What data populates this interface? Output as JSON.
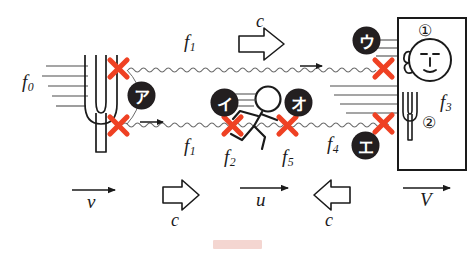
{
  "diagram": {
    "colors": {
      "ink": "#1a1a1a",
      "cross_red": "#ef4123",
      "marker_fill": "#231f20",
      "marker_text": "#ffffff",
      "wave": "#4d4d4d",
      "watermark": "#f2cfc9",
      "background": "#ffffff"
    }
  },
  "frequency_labels": [
    {
      "id": "f0",
      "base": "f",
      "sub": "0",
      "note": "source frequency at tuning fork"
    },
    {
      "id": "f1_top",
      "base": "f",
      "sub": "1",
      "note": "upper wave train frequency"
    },
    {
      "id": "f1_bottom",
      "base": "f",
      "sub": "1",
      "note": "lower wave train frequency"
    },
    {
      "id": "f2",
      "base": "f",
      "sub": "2",
      "note": "frequency at runner, left side"
    },
    {
      "id": "f5",
      "base": "f",
      "sub": "5",
      "note": "frequency at runner, right side"
    },
    {
      "id": "f4",
      "base": "f",
      "sub": "4",
      "note": "frequency approaching the wall"
    },
    {
      "id": "f3",
      "base": "f",
      "sub": "3",
      "note": "frequency heard by listener"
    }
  ],
  "velocity_labels": [
    {
      "id": "v",
      "text": "v",
      "note": "tuning fork velocity, arrow right"
    },
    {
      "id": "u",
      "text": "u",
      "note": "runner velocity, arrow right"
    },
    {
      "id": "V",
      "text": "V",
      "note": "wall/panel velocity, arrow right"
    }
  ],
  "sound_speed_labels": [
    {
      "id": "c_top",
      "text": "c",
      "direction": "right"
    },
    {
      "id": "c_bottom_left",
      "text": "c",
      "direction": "right"
    },
    {
      "id": "c_bottom_right",
      "text": "c",
      "direction": "left"
    }
  ],
  "katakana_markers": [
    {
      "id": "a",
      "text": "ア",
      "x": 128,
      "y": 82,
      "note": "marker near tuning fork"
    },
    {
      "id": "i",
      "text": "イ",
      "x": 211,
      "y": 89,
      "note": "marker left of runner"
    },
    {
      "id": "u",
      "text": "ウ",
      "x": 353,
      "y": 27,
      "note": "marker upper right"
    },
    {
      "id": "e",
      "text": "エ",
      "x": 352,
      "y": 132,
      "note": "marker lower right"
    },
    {
      "id": "o",
      "text": "オ",
      "x": 285,
      "y": 89,
      "note": "marker right of runner"
    }
  ],
  "circled_numbers": [
    {
      "id": "one",
      "text": "①",
      "note": "panel top — listener ear"
    },
    {
      "id": "two",
      "text": "②",
      "note": "panel bottom — tuning fork inside panel"
    }
  ],
  "cross_marks": [
    {
      "id": "x1",
      "x": 118,
      "y": 68,
      "note": "upper left, on upper wave"
    },
    {
      "id": "x2",
      "x": 118,
      "y": 125,
      "note": "lower left, on lower wave"
    },
    {
      "id": "x3",
      "x": 232,
      "y": 125,
      "note": "left of runner, on lower wave"
    },
    {
      "id": "x4",
      "x": 287,
      "y": 125,
      "note": "right of runner, on lower wave"
    },
    {
      "id": "x5",
      "x": 383,
      "y": 68,
      "note": "upper right, on upper wave"
    },
    {
      "id": "x6",
      "x": 383,
      "y": 123,
      "note": "lower right, on lower wave"
    }
  ],
  "objects": [
    {
      "id": "tuning-fork-left",
      "note": "large tuning fork source on left, moving right at v"
    },
    {
      "id": "runner",
      "note": "stick figure running right at u between the two waves"
    },
    {
      "id": "listener-panel",
      "note": "rectangular panel on right containing face with ear and a small tuning fork"
    }
  ]
}
